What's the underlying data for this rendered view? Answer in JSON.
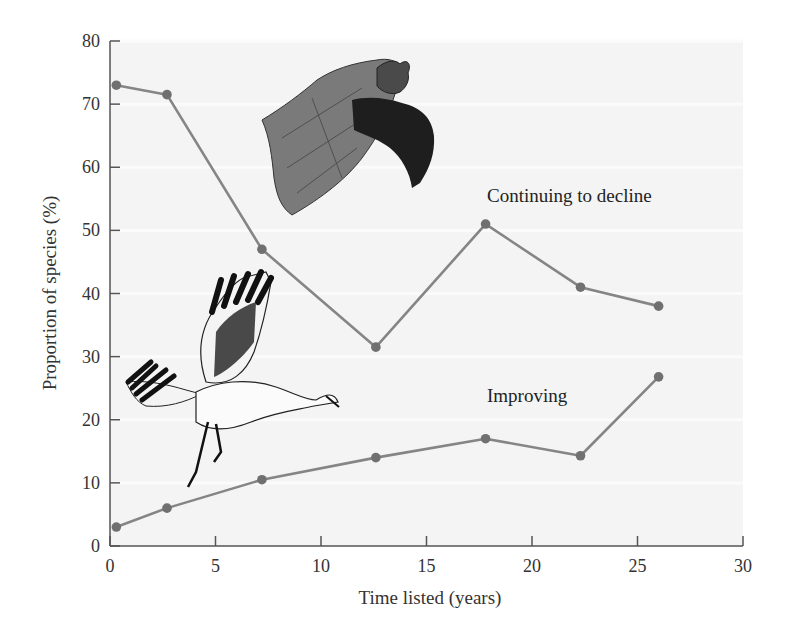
{
  "chart_data": {
    "type": "line",
    "title": "",
    "xlabel": "Time listed (years)",
    "ylabel": "Proportion of species (%)",
    "xlim": [
      0,
      30
    ],
    "ylim": [
      0,
      80
    ],
    "xticks": [
      0,
      5,
      10,
      15,
      20,
      25,
      30
    ],
    "yticks": [
      0,
      10,
      20,
      30,
      40,
      50,
      60,
      70,
      80
    ],
    "grid": "faint horizontal",
    "legend": "none (direct labels on lines)",
    "series": [
      {
        "name": "Continuing to decline",
        "x": [
          0.3,
          2.7,
          7.2,
          12.6,
          17.8,
          22.3,
          26.0
        ],
        "values": [
          73,
          71.5,
          47,
          31.5,
          51,
          41,
          38
        ]
      },
      {
        "name": "Improving",
        "x": [
          0.3,
          2.7,
          7.2,
          12.6,
          17.8,
          22.3,
          26.0
        ],
        "values": [
          3,
          6,
          10.5,
          14,
          17,
          14.3,
          26.8
        ]
      }
    ],
    "annotations": [
      {
        "text": "Continuing to decline",
        "x": 17.8,
        "y": 55
      },
      {
        "text": "Improving",
        "x": 17.8,
        "y": 24
      }
    ],
    "illustrations": [
      "bat",
      "whooping-crane"
    ]
  },
  "colors": {
    "line": "#858585",
    "marker": "#707070",
    "axis": "#555555",
    "plot_bg": "#f4f4f4",
    "grid": "#fbfbfb"
  }
}
